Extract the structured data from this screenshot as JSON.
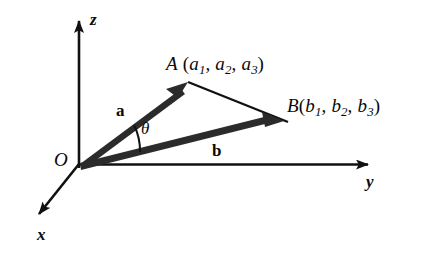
{
  "figure": {
    "background_color": "#ffffff",
    "stroke_color": "#111111"
  },
  "axes": [
    {
      "name": "z-axis",
      "label": "z",
      "direction": "up"
    },
    {
      "name": "y-axis",
      "label": "y",
      "direction": "right"
    },
    {
      "name": "x-axis",
      "label": "x",
      "direction": "down-left"
    }
  ],
  "origin": {
    "label": "O"
  },
  "vectors": [
    {
      "name": "vector-a",
      "label": "a",
      "from": "O",
      "to": "A"
    },
    {
      "name": "vector-b",
      "label": "b",
      "from": "O",
      "to": "B"
    }
  ],
  "angle": {
    "label": "θ",
    "between": [
      "a",
      "b"
    ]
  },
  "points": [
    {
      "name": "point-A",
      "letter": "A",
      "open_paren": " (",
      "components": [
        "a",
        "a",
        "a"
      ],
      "subscripts": [
        "1",
        "2",
        "3"
      ],
      "separator": ", ",
      "close_paren": ")",
      "full_text": "A (a1, a2, a3)"
    },
    {
      "name": "point-B",
      "letter": "B",
      "open_paren": "(",
      "components": [
        "b",
        "b",
        "b"
      ],
      "subscripts": [
        "1",
        "2",
        "3"
      ],
      "separator": ", ",
      "close_paren": ")",
      "full_text": "B(b1, b2, b3)"
    }
  ],
  "segments": [
    {
      "name": "segment-AB",
      "from": "A",
      "to": "B",
      "style": "thin"
    }
  ]
}
